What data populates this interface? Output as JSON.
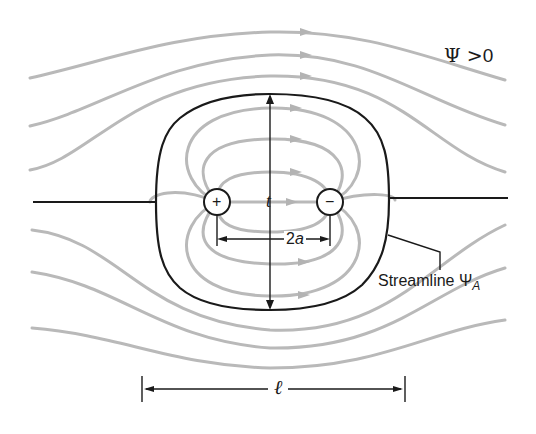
{
  "figure": {
    "type": "Rankine oval flow diagram (source–sink pair in uniform stream)",
    "labels": {
      "psi_region": "Ψ > 0",
      "psi_symbol": "Ψ",
      "psi_relation": ">",
      "psi_value": "0",
      "streamline_text": "Streamline Ψ",
      "streamline_subscript": "A",
      "thickness": "t",
      "separation": "2a",
      "separation_coeff": "2",
      "separation_var": "a",
      "length": "ℓ"
    },
    "source": {
      "symbol": "+",
      "role": "source"
    },
    "sink": {
      "symbol": "−",
      "role": "sink"
    },
    "colors": {
      "streamlines": "#b9b9b9",
      "oval_outline": "#1a1a1a",
      "background": "#ffffff"
    }
  }
}
